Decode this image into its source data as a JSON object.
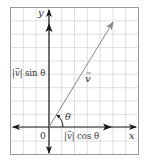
{
  "diagram": {
    "labels": {
      "x_axis": "x",
      "y_axis": "y",
      "origin": "0",
      "vector": "v",
      "angle": "θ",
      "vertical_component_mag": "|v|",
      "vertical_component_fn": "sin θ",
      "horizontal_component_mag": "|v|",
      "horizontal_component_fn": "cos θ"
    },
    "colors": {
      "grid": "#d8d8d8",
      "frame": "#999999",
      "axes": "#1a1a1a",
      "vector": "#888888",
      "text": "#333333"
    },
    "grid": {
      "columns": 10,
      "rows": 11
    },
    "vector_angle_deg": 58
  }
}
